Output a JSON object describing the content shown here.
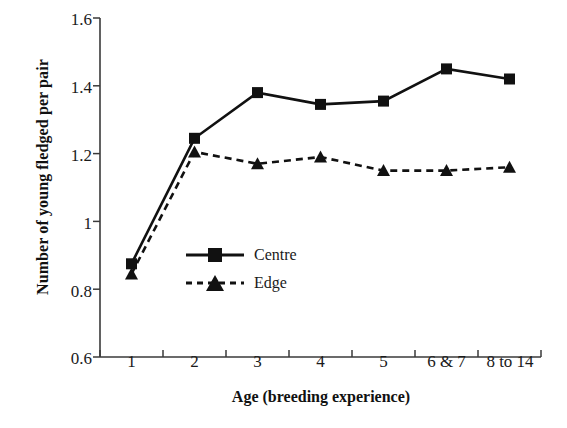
{
  "chart_data": {
    "type": "line",
    "title": "",
    "xlabel": "Age (breeding experience)",
    "ylabel": "Number of young fledged per pair",
    "categories": [
      "1",
      "2",
      "3",
      "4",
      "5",
      "6 & 7",
      "8 to 14"
    ],
    "ylim": [
      0.6,
      1.6
    ],
    "yticks": [
      0.6,
      0.8,
      1.0,
      1.2,
      1.4,
      1.6
    ],
    "ytick_labels": [
      "0.6",
      "0.8",
      "1",
      "1.2",
      "1.4",
      "1.6"
    ],
    "grid": false,
    "legend_position": "inside-center-left",
    "series": [
      {
        "name": "Centre",
        "values": [
          0.875,
          1.245,
          1.38,
          1.345,
          1.355,
          1.45,
          1.42
        ],
        "marker": "square",
        "line_style": "solid",
        "color": "#111111"
      },
      {
        "name": "Edge",
        "values": [
          0.845,
          1.205,
          1.17,
          1.19,
          1.15,
          1.15,
          1.16
        ],
        "marker": "triangle",
        "line_style": "dashed",
        "color": "#111111"
      }
    ]
  },
  "axes": {
    "y_title": "Number of young fledged per pair",
    "x_title": "Age (breeding experience)",
    "y_tick_labels": [
      "1.6",
      "1.4",
      "1.2",
      "1",
      "0.8",
      "0.6"
    ],
    "x_tick_labels": [
      "1",
      "2",
      "3",
      "4",
      "5",
      "6 & 7",
      "8 to 14"
    ]
  },
  "legend": {
    "entries": [
      {
        "label": "Centre",
        "marker": "square-marker",
        "style": "solid"
      },
      {
        "label": "Edge",
        "marker": "triangle-marker",
        "style": "dashed"
      }
    ]
  },
  "colors": {
    "axis": "#3a3a3a",
    "series": "#111111",
    "background": "#ffffff"
  }
}
